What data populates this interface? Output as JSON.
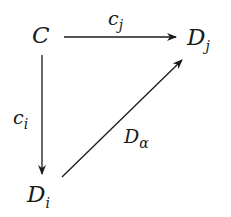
{
  "diagram": {
    "type": "commutative-diagram",
    "nodes": {
      "C": {
        "base": "C",
        "sub": ""
      },
      "Dj": {
        "base": "D",
        "sub": "j"
      },
      "Di": {
        "base": "D",
        "sub": "i"
      }
    },
    "arrows": {
      "cj": {
        "from": "C",
        "to": "Dj",
        "base": "c",
        "sub": "j"
      },
      "ci": {
        "from": "C",
        "to": "Di",
        "base": "c",
        "sub": "i"
      },
      "Dalpha": {
        "from": "Di",
        "to": "Dj",
        "base": "D",
        "sub": "α"
      }
    },
    "colors": {
      "ink": "#1a1a1a",
      "background": "#ffffff"
    }
  }
}
